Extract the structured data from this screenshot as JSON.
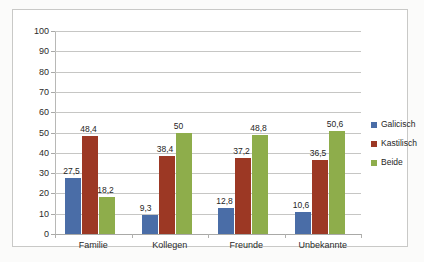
{
  "chart_data": {
    "type": "bar",
    "title": "",
    "subtitle": "",
    "xlabel": "",
    "ylabel": "",
    "ylim": [
      0,
      100
    ],
    "ytick_step": 10,
    "yticks": [
      "100",
      "90",
      "80",
      "70",
      "60",
      "50",
      "40",
      "30",
      "20",
      "10",
      "0"
    ],
    "grid": true,
    "legend_position": "right",
    "categories": [
      "Familie",
      "Kollegen",
      "Freunde",
      "Unbekannte"
    ],
    "series": [
      {
        "name": "Galicisch",
        "color": "#4a6da7",
        "values": [
          27.5,
          9.3,
          12.8,
          10.6
        ],
        "labels": [
          "27,5",
          "9,3",
          "12,8",
          "10,6"
        ]
      },
      {
        "name": "Kastilisch",
        "color": "#9c3824",
        "values": [
          48.4,
          38.4,
          37.2,
          36.5
        ],
        "labels": [
          "48,4",
          "38,4",
          "37,2",
          "36,5"
        ]
      },
      {
        "name": "Beide",
        "color": "#8ead4b",
        "values": [
          18.2,
          50.0,
          48.8,
          50.6
        ],
        "labels": [
          "18,2",
          "50",
          "48,8",
          "50,6"
        ]
      }
    ]
  },
  "legend": {
    "items": [
      {
        "label": "Galicisch",
        "color": "#4a6da7"
      },
      {
        "label": "Kastilisch",
        "color": "#9c3824"
      },
      {
        "label": "Beide",
        "color": "#8ead4b"
      }
    ]
  }
}
